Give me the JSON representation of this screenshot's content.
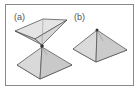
{
  "figure": {
    "panels": [
      {
        "label": "(a)",
        "description": "double pyramid touching at apexes"
      },
      {
        "label": "(b)",
        "description": "single square pyramid with apex vertex"
      }
    ]
  },
  "colors": {
    "frame": "#8a8a8a",
    "edge": "#555555",
    "face_light": "#e6e6e6",
    "face_mid": "#d2d2d2",
    "face_dark": "#bdbdbd",
    "vertex": "#333333"
  }
}
